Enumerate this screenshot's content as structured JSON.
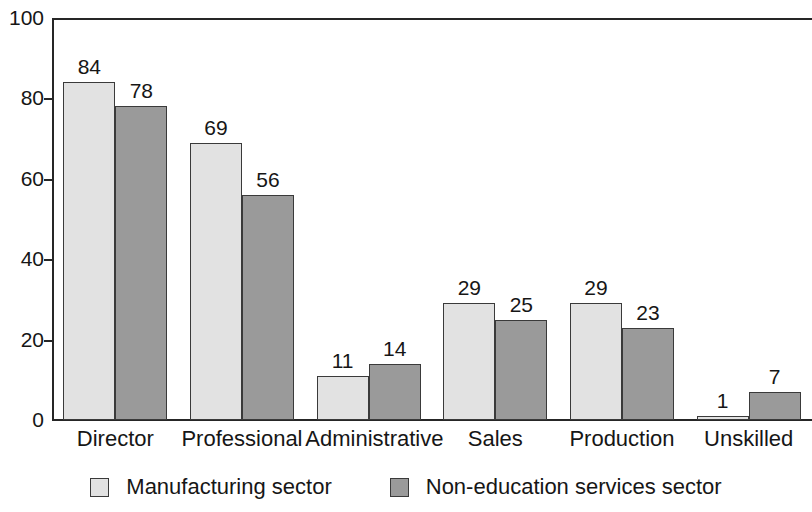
{
  "chart_data": {
    "type": "bar",
    "title": "",
    "subtitle": "",
    "xlabel": "",
    "ylabel": "",
    "ylim": [
      0,
      100
    ],
    "yticks": [
      0,
      20,
      40,
      60,
      80,
      100
    ],
    "grid": false,
    "legend_position": "bottom-center",
    "categories": [
      "Director",
      "Professional",
      "Administrative",
      "Sales",
      "Production",
      "Unskilled"
    ],
    "series": [
      {
        "name": "Manufacturing sector",
        "color": "#e2e2e2",
        "values": [
          84,
          69,
          11,
          29,
          29,
          1
        ]
      },
      {
        "name": "Non-education services sector",
        "color": "#9a9a9a",
        "values": [
          78,
          56,
          14,
          25,
          23,
          7
        ]
      }
    ]
  },
  "axis": {
    "y_tick_labels": [
      "100",
      "80",
      "60",
      "40",
      "20",
      "0"
    ]
  },
  "legend": {
    "items": [
      {
        "label": "Manufacturing sector",
        "swatch": "light-square-swatch"
      },
      {
        "label": "Non-education services sector",
        "swatch": "dark-square-swatch"
      }
    ]
  }
}
